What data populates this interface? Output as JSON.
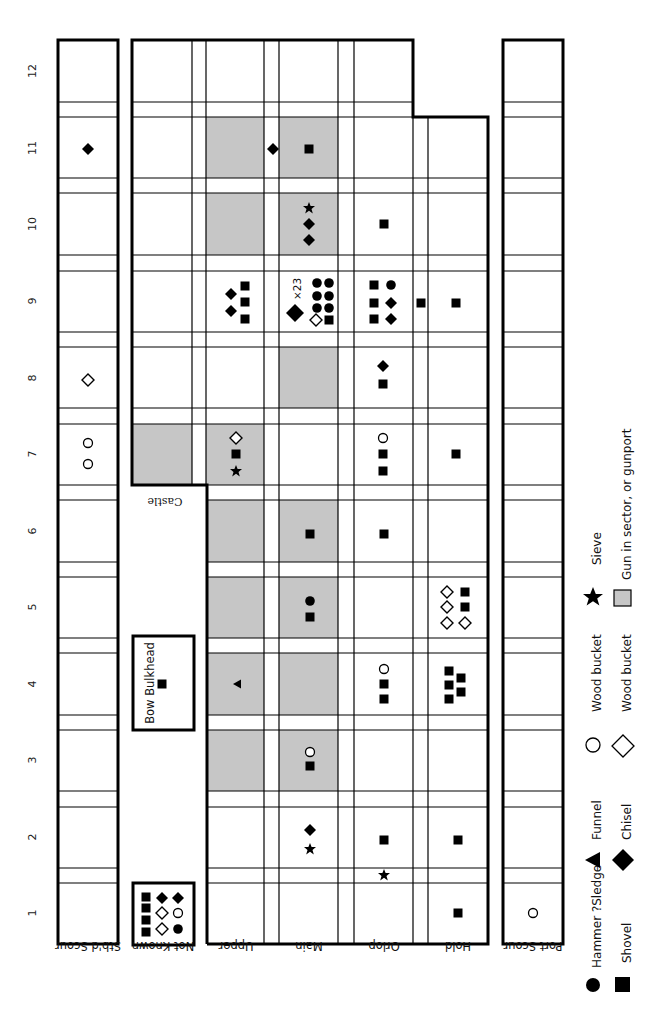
{
  "diagram": {
    "title": "",
    "orientation": "rotated 90deg counter-clockwise",
    "row_numbers": [
      "1",
      "2",
      "3",
      "4",
      "5",
      "6",
      "7",
      "8",
      "9",
      "10",
      "11",
      "12"
    ],
    "column_labels": {
      "stbd_scour": "Stb'd Scour",
      "not_known": "Not Known",
      "upper": "Upper",
      "main": "Main",
      "orlop": "Orlop",
      "hold": "Hold",
      "port_scour": "Port Scour"
    },
    "castle_label": "Castle",
    "bow_bulkhead_label": "Bow Bulkhead",
    "count_label": "×23",
    "shade_color": "#c6c6c6",
    "shaded_cells": [
      {
        "col": "upper",
        "row": 11
      },
      {
        "col": "upper",
        "row": 10
      },
      {
        "col": "upper",
        "row": 6
      },
      {
        "col": "upper",
        "row": 5
      },
      {
        "col": "upper",
        "row": 4
      },
      {
        "col": "upper",
        "row": 3
      },
      {
        "col": "upper",
        "row": 7
      },
      {
        "col": "castle",
        "row": 7
      },
      {
        "col": "main",
        "row": 11
      },
      {
        "col": "main",
        "row": 10
      },
      {
        "col": "main",
        "row": 8
      },
      {
        "col": "main",
        "row": 6
      },
      {
        "col": "main",
        "row": 5
      },
      {
        "col": "main",
        "row": 4
      },
      {
        "col": "main",
        "row": 3
      }
    ],
    "finds": [
      {
        "location": "Stb'd Scour",
        "row": 11,
        "items": [
          "chisel"
        ]
      },
      {
        "location": "Stb'd Scour",
        "row": 8,
        "items": [
          "wood bucket (diamond)"
        ]
      },
      {
        "location": "Stb'd Scour",
        "row": 7,
        "items": [
          "wood bucket (circle)",
          "wood bucket (circle)"
        ]
      },
      {
        "location": "Upper/Main boundary",
        "row": 11,
        "items": [
          "chisel"
        ]
      },
      {
        "location": "Main",
        "row": 11,
        "items": [
          "shovel"
        ]
      },
      {
        "location": "Main",
        "row": 10,
        "items": [
          "sieve",
          "chisel",
          "chisel"
        ]
      },
      {
        "location": "Orlop",
        "row": 10,
        "items": [
          "shovel"
        ]
      },
      {
        "location": "Upper",
        "row": 9,
        "items": [
          "chisel",
          "chisel",
          "shovel",
          "shovel",
          "shovel"
        ]
      },
      {
        "location": "Main",
        "row": 9,
        "items": [
          "chisel x23",
          "hammer ?sledge x6",
          "wood bucket (diamond)",
          "shovel"
        ]
      },
      {
        "location": "Orlop",
        "row": 9,
        "items": [
          "shovel",
          "shovel",
          "shovel",
          "hammer ?sledge",
          "chisel",
          "chisel"
        ]
      },
      {
        "location": "Orlop/Hold boundary",
        "row": 9,
        "items": [
          "shovel"
        ]
      },
      {
        "location": "Hold",
        "row": 9,
        "items": [
          "shovel"
        ]
      },
      {
        "location": "Orlop",
        "row": 8,
        "items": [
          "chisel",
          "shovel"
        ]
      },
      {
        "location": "Upper",
        "row": 7,
        "items": [
          "wood bucket (diamond)",
          "shovel",
          "sieve"
        ]
      },
      {
        "location": "Orlop",
        "row": 7,
        "items": [
          "wood bucket (circle)",
          "shovel",
          "shovel"
        ]
      },
      {
        "location": "Hold",
        "row": 7,
        "items": [
          "shovel"
        ]
      },
      {
        "location": "Main",
        "row": 6,
        "items": [
          "shovel"
        ]
      },
      {
        "location": "Orlop",
        "row": 6,
        "items": [
          "shovel"
        ]
      },
      {
        "location": "Main",
        "row": 5,
        "items": [
          "hammer ?sledge",
          "shovel"
        ]
      },
      {
        "location": "Hold",
        "row": 5,
        "items": [
          "wood bucket (diamond) x4",
          "shovel",
          "shovel"
        ]
      },
      {
        "location": "Bow Bulkhead",
        "row": 4,
        "items": [
          "shovel"
        ]
      },
      {
        "location": "Upper",
        "row": 4,
        "items": [
          "funnel"
        ]
      },
      {
        "location": "Orlop",
        "row": 4,
        "items": [
          "wood bucket (circle)",
          "shovel",
          "shovel"
        ]
      },
      {
        "location": "Hold",
        "row": 4,
        "items": [
          "shovel x5"
        ]
      },
      {
        "location": "Main",
        "row": 3,
        "items": [
          "wood bucket (circle)",
          "shovel"
        ]
      },
      {
        "location": "Main",
        "row": 2,
        "items": [
          "chisel",
          "sieve"
        ]
      },
      {
        "location": "Orlop",
        "row": 2,
        "items": [
          "shovel"
        ]
      },
      {
        "location": "Hold",
        "row": 2,
        "items": [
          "shovel"
        ]
      },
      {
        "location": "Orlop",
        "row": "1/2 boundary",
        "items": [
          "sieve"
        ]
      },
      {
        "location": "Hold",
        "row": 1,
        "items": [
          "shovel"
        ]
      },
      {
        "location": "Port Scour",
        "row": 1,
        "items": [
          "wood bucket (circle)"
        ]
      },
      {
        "location": "Not Known",
        "row": "",
        "items": [
          "shovel x4",
          "chisel x2",
          "wood bucket (diamond) x2",
          "wood bucket (circle)",
          "hammer ?sledge"
        ]
      }
    ]
  },
  "legend": {
    "items": [
      {
        "icon": "filled-circle-icon",
        "label": "Hammer ?Sledge"
      },
      {
        "icon": "filled-square-icon",
        "label": "Shovel"
      },
      {
        "icon": "filled-triangle-icon",
        "label": "Funnel"
      },
      {
        "icon": "filled-diamond-icon",
        "label": "Chisel"
      },
      {
        "icon": "open-circle-icon",
        "label": "Wood bucket"
      },
      {
        "icon": "open-diamond-icon",
        "label": "Wood bucket"
      },
      {
        "icon": "star-icon",
        "label": "Sieve"
      },
      {
        "icon": "gray-square-icon",
        "label": "Gun in sector, or gunport"
      }
    ]
  }
}
